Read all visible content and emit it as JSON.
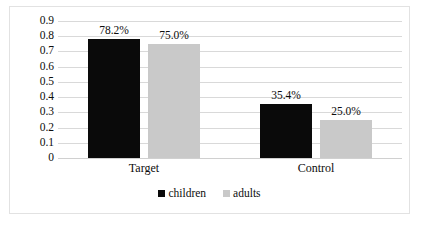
{
  "chart_data": {
    "type": "bar",
    "title": "",
    "subtitle": "",
    "xlabel": "",
    "ylabel": "",
    "categories": [
      "Target",
      "Control"
    ],
    "series": [
      {
        "name": "children",
        "color": "#0a0a0a",
        "values": [
          0.782,
          0.354
        ],
        "labels": [
          "78.2%",
          "25.0%"
        ]
      },
      {
        "name": "adults",
        "color": "#c9c9c9",
        "values": [
          0.75,
          0.25
        ],
        "labels": [
          "75.0%",
          "25.0%"
        ]
      }
    ],
    "point_labels": [
      [
        "78.2%",
        "35.4%"
      ],
      [
        "75.0%",
        "25.0%"
      ]
    ],
    "ylim": [
      0,
      0.9
    ],
    "ytick_values": [
      0.9,
      0.8,
      0.7,
      0.6,
      0.5,
      0.4,
      0.3,
      0.2,
      0.1,
      0
    ],
    "ytick_labels": [
      "0.9",
      "0.8",
      "0.7",
      "0.6",
      "0.5",
      "0.4",
      "0.3",
      "0.2",
      "0.1",
      "0"
    ],
    "grid": "horizontal",
    "legend_position": "bottom-center",
    "legend_entries": [
      "children",
      "adults"
    ],
    "border_color": "#e2e2e2",
    "gridline_color": "#d9d9d9"
  }
}
